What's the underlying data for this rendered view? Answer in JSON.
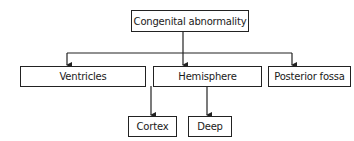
{
  "diagram": {
    "root": {
      "label": "Congenital abnormality"
    },
    "level1": [
      {
        "label": "Ventricles"
      },
      {
        "label": "Hemisphere"
      },
      {
        "label": "Posterior fossa"
      }
    ],
    "level2": [
      {
        "label": "Cortex",
        "parent": "Hemisphere"
      },
      {
        "label": "Deep",
        "parent": "Hemisphere"
      }
    ],
    "colors": {
      "line": "#222222",
      "box_border": "#222222",
      "background": "#ffffff",
      "text": "#1a1a1a"
    }
  }
}
